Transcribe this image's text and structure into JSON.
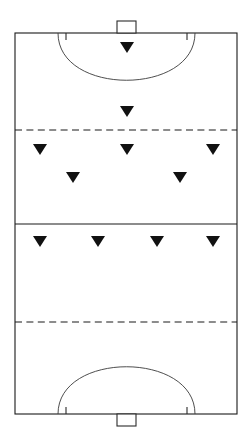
{
  "diagram": {
    "type": "sports-field-diagram",
    "sport": "field-hockey",
    "orientation": "portrait",
    "colors": {
      "background": "#ffffff",
      "line": "#1a1a1a",
      "arc": "#3a3a3a",
      "marker": "#111111"
    },
    "canvas": {
      "width": 252,
      "height": 443
    },
    "pitch": {
      "left": 15,
      "right": 237,
      "top": 33,
      "bottom": 414
    },
    "halfway_line": {
      "y": 224,
      "style": "solid"
    },
    "quarter_lines": [
      {
        "name": "top-25-yard-line",
        "y": 130,
        "style": "dashed"
      },
      {
        "name": "bottom-25-yard-line",
        "y": 322,
        "style": "dashed"
      }
    ],
    "goals": [
      {
        "name": "top-goal",
        "x": 117,
        "width": 19,
        "depth": 12,
        "side": "top"
      },
      {
        "name": "bottom-goal",
        "x": 117,
        "width": 19,
        "depth": 12,
        "side": "bottom"
      }
    ],
    "shooting_circles": [
      {
        "name": "top-shooting-circle",
        "path": "M 58 33 C 58 96 195 96 195 33",
        "tick_left_x": 66,
        "tick_right_x": 187,
        "tick_y": 33,
        "tick_length": 7,
        "side": "top"
      },
      {
        "name": "bottom-shooting-circle",
        "path": "M 58 414 C 58 351 195 351 195 414",
        "tick_left_x": 66,
        "tick_right_x": 187,
        "tick_y": 414,
        "tick_length": 7,
        "side": "bottom"
      }
    ],
    "markers": {
      "shape": "triangle-down",
      "width": 14,
      "height": 11,
      "rows": [
        {
          "name": "row-attacking-circle",
          "positions": [
            {
              "cx": 127,
              "cy": 42
            }
          ]
        },
        {
          "name": "row-top-of-circle",
          "positions": [
            {
              "cx": 127,
              "cy": 106
            }
          ]
        },
        {
          "name": "row-on-25-yard-line",
          "positions": [
            {
              "cx": 40,
              "cy": 144
            },
            {
              "cx": 127,
              "cy": 144
            },
            {
              "cx": 213,
              "cy": 144
            }
          ]
        },
        {
          "name": "row-midfield-inner",
          "positions": [
            {
              "cx": 73,
              "cy": 172
            },
            {
              "cx": 180,
              "cy": 172
            }
          ]
        },
        {
          "name": "row-below-halfway",
          "positions": [
            {
              "cx": 40,
              "cy": 236
            },
            {
              "cx": 98,
              "cy": 236
            },
            {
              "cx": 157,
              "cy": 236
            },
            {
              "cx": 213,
              "cy": 236
            }
          ]
        }
      ]
    }
  }
}
